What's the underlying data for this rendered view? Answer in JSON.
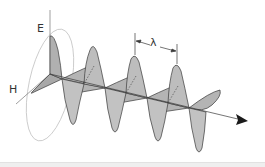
{
  "diagram": {
    "labels": {
      "electric_field": "E",
      "magnetic_field": "H",
      "wavelength": "λ"
    },
    "colors": {
      "background": "#ffffff",
      "wave_fill": "#b4b4b4",
      "wave_fill_dark": "#9e9e9e",
      "stroke": "#3a3a3a",
      "circle": "#bbbbbb",
      "footer": "#efefef"
    },
    "icons": {
      "propagation_arrow": "arrow-right-icon"
    }
  }
}
